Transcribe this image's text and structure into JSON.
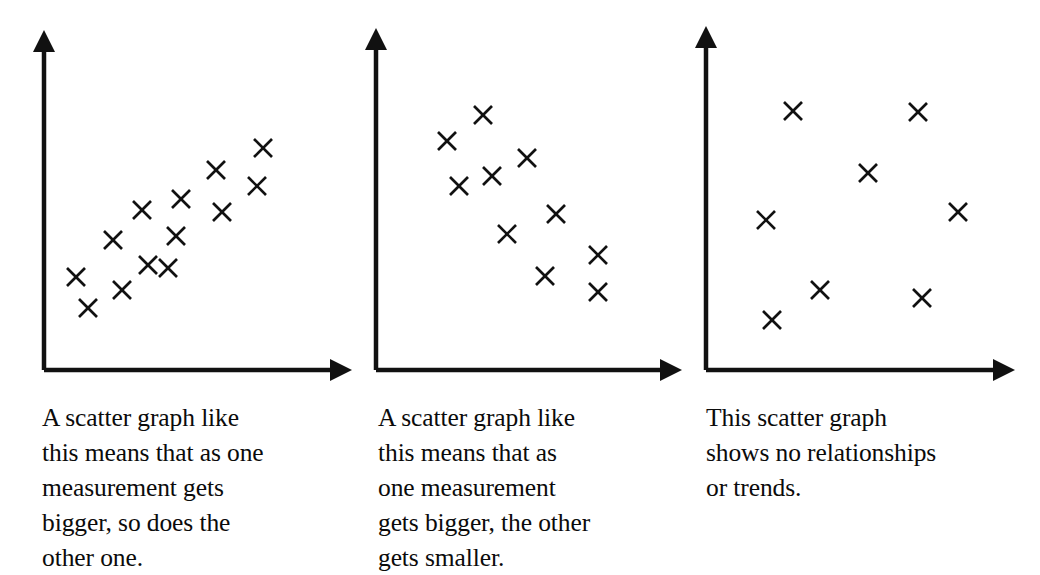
{
  "figure": {
    "background_color": "#ffffff",
    "ink_color": "#111111"
  },
  "panels": [
    {
      "id": "positive-correlation",
      "caption": "A scatter graph like\nthis means that as one\nmeasurement gets\nbigger, so does the\nother one.",
      "axis": {
        "origin_x": 44,
        "origin_y": 370,
        "y_top": 30,
        "x_right": 352,
        "arrow": "solid-triangle"
      }
    },
    {
      "id": "negative-correlation",
      "caption": "A scatter graph like\nthis means that as\none measurement\ngets bigger, the other\ngets smaller.",
      "axis": {
        "origin_x": 16,
        "origin_y": 370,
        "y_top": 28,
        "x_right": 322,
        "arrow": "solid-triangle"
      }
    },
    {
      "id": "no-correlation",
      "caption": "This scatter graph\nshows no relationships\nor trends.",
      "axis": {
        "origin_x": 16,
        "origin_y": 370,
        "y_top": 26,
        "x_right": 325,
        "arrow": "solid-triangle"
      }
    }
  ],
  "chart_data": [
    {
      "type": "scatter",
      "title": "Positive correlation",
      "xlabel": "",
      "ylabel": "",
      "xlim": [
        0,
        360
      ],
      "ylim": [
        0,
        370
      ],
      "grid": false,
      "legend": "none",
      "marker": "x",
      "annotation": "A scatter graph like this means that as one measurement gets bigger, so does the other one.",
      "points": [
        {
          "x": 76,
          "y": 277
        },
        {
          "x": 88,
          "y": 308
        },
        {
          "x": 113,
          "y": 240
        },
        {
          "x": 122,
          "y": 290
        },
        {
          "x": 142,
          "y": 210
        },
        {
          "x": 148,
          "y": 265
        },
        {
          "x": 168,
          "y": 268
        },
        {
          "x": 176,
          "y": 236
        },
        {
          "x": 181,
          "y": 199
        },
        {
          "x": 216,
          "y": 170
        },
        {
          "x": 222,
          "y": 212
        },
        {
          "x": 257,
          "y": 186
        },
        {
          "x": 263,
          "y": 148
        }
      ]
    },
    {
      "type": "scatter",
      "title": "Negative correlation",
      "xlabel": "",
      "ylabel": "",
      "xlim": [
        0,
        330
      ],
      "ylim": [
        0,
        370
      ],
      "grid": false,
      "legend": "none",
      "marker": "x",
      "annotation": "A scatter graph like this means that as one measurement gets bigger, the other gets smaller.",
      "points": [
        {
          "x": 87,
          "y": 141
        },
        {
          "x": 99,
          "y": 186
        },
        {
          "x": 123,
          "y": 115
        },
        {
          "x": 132,
          "y": 176
        },
        {
          "x": 147,
          "y": 234
        },
        {
          "x": 167,
          "y": 158
        },
        {
          "x": 185,
          "y": 276
        },
        {
          "x": 196,
          "y": 214
        },
        {
          "x": 238,
          "y": 255
        },
        {
          "x": 238,
          "y": 292
        }
      ]
    },
    {
      "type": "scatter",
      "title": "No correlation",
      "xlabel": "",
      "ylabel": "",
      "xlim": [
        0,
        350
      ],
      "ylim": [
        0,
        370
      ],
      "grid": false,
      "legend": "none",
      "marker": "x",
      "annotation": "This scatter graph shows no relationships or trends.",
      "points": [
        {
          "x": 103,
          "y": 111
        },
        {
          "x": 228,
          "y": 112
        },
        {
          "x": 178,
          "y": 173
        },
        {
          "x": 76,
          "y": 220
        },
        {
          "x": 268,
          "y": 212
        },
        {
          "x": 130,
          "y": 290
        },
        {
          "x": 232,
          "y": 298
        },
        {
          "x": 82,
          "y": 320
        }
      ]
    }
  ]
}
